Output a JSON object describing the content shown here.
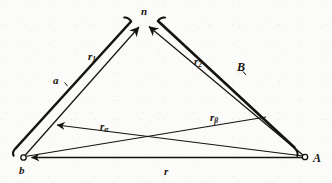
{
  "figure": {
    "kind": "vector-geometry-diagram",
    "background_color": "#fbfbf9",
    "ink_color": "#15130f",
    "width": 332,
    "height": 183,
    "points": [
      {
        "name": "b",
        "label": "b",
        "x": 23,
        "y": 158,
        "marker": "open-circle"
      },
      {
        "name": "A",
        "label": "A",
        "x": 305,
        "y": 157,
        "marker": "open-circle"
      },
      {
        "name": "n",
        "label": "n",
        "x": 144,
        "y": 22,
        "marker": "none"
      }
    ],
    "vectors": [
      {
        "name": "r1",
        "label": "r",
        "subscript": "1",
        "from": "b",
        "to": "n",
        "arrowhead": "to"
      },
      {
        "name": "r2",
        "label": "r",
        "subscript": "2",
        "from": "A",
        "to": "n",
        "arrowhead": "to"
      },
      {
        "name": "ralpha",
        "label": "r",
        "subscript": "α",
        "from": "A",
        "to": "left-edge-point",
        "arrowhead": "to"
      },
      {
        "name": "rbeta",
        "label": "r",
        "subscript": "β",
        "from": "b",
        "to": "right-edge-point",
        "arrowhead": "none"
      },
      {
        "name": "r",
        "label": "r",
        "subscript": "",
        "from": "A",
        "to": "b",
        "arrowhead": "to"
      }
    ],
    "braces": [
      {
        "name": "brace-a",
        "label": "a",
        "side": "left",
        "spans": "b-to-n"
      },
      {
        "name": "brace-B",
        "label": "B",
        "side": "right",
        "spans": "n-to-A"
      }
    ],
    "labels": {
      "apex": "n",
      "left_side": "a",
      "right_side": "B",
      "left_vector": "r",
      "left_vector_sub": "1",
      "right_vector": "r",
      "right_vector_sub": "2",
      "alpha_vector": "r",
      "alpha_vector_sub": "α",
      "beta_vector": "r",
      "beta_vector_sub": "β",
      "base_vector": "r",
      "origin_point": "b",
      "end_point": "A"
    }
  }
}
